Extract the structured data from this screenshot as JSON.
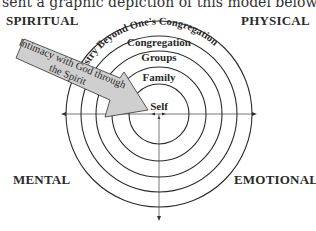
{
  "intro_text": "sent a graphic depiction of this model below:",
  "quadrants": {
    "top_left": "SPIRITUAL",
    "top_right": "PHYSICAL",
    "bottom_left": "MENTAL",
    "bottom_right": "EMOTIONAL"
  },
  "rings": {
    "outer": "Ministry Beyond One's Congregation",
    "ring4": "Congregation",
    "ring3": "Groups",
    "ring2": "Family",
    "center": "Self"
  },
  "arrow": {
    "line1": "Intimacy with God through",
    "line2": "the Spirit",
    "fill_color": "#cfcfcf"
  }
}
